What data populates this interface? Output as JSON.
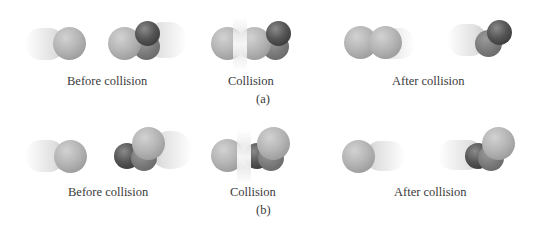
{
  "figure": {
    "panels": [
      {
        "id": "a",
        "panel_label": "(a)",
        "stages": [
          {
            "label": "Before collision"
          },
          {
            "label": "Collision"
          },
          {
            "label": "After collision"
          }
        ]
      },
      {
        "id": "b",
        "panel_label": "(b)",
        "stages": [
          {
            "label": "Before collision"
          },
          {
            "label": "Collision"
          },
          {
            "label": "After collision"
          }
        ]
      }
    ],
    "colors": {
      "light_atom": "#b5b5b5",
      "dark_atom": "#3a3a3a",
      "mid_atom": "#6e6e6e",
      "background": "#ffffff"
    }
  }
}
